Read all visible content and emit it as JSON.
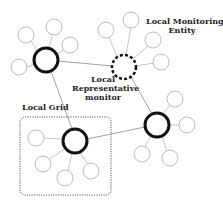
{
  "labels": {
    "monitoring_entity_line1": "Local Monitoring",
    "monitoring_entity_line2": "Entity",
    "representative_line1": "Local",
    "representative_line2": "Representative",
    "representative_line3": "monitor",
    "local_grid": "Local Grid"
  },
  "colors": {
    "hub_stroke": "#111111",
    "leaf_stroke": "#aaaaaa",
    "link_stroke": "#888888",
    "grid_box_stroke": "#555555"
  }
}
